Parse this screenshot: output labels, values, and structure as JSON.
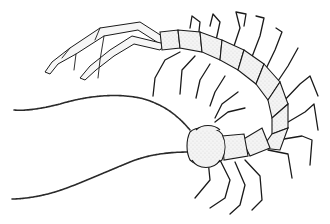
{
  "image": {
    "subject": "centipede",
    "style": "black ink line illustration with stippling",
    "background_color": "#ffffff",
    "ink_color": "#1a1a1a"
  }
}
